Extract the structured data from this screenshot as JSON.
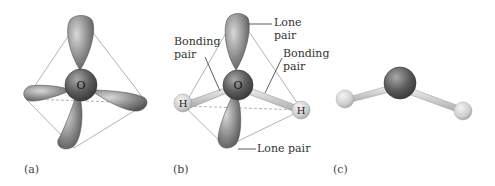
{
  "panels": [
    {
      "id": "a",
      "label": "(a)",
      "center_atom": "O"
    },
    {
      "id": "b",
      "label": "(b)",
      "center_atom": "O",
      "hydrogen_atoms": [
        "H",
        "H"
      ],
      "annotations": {
        "lone_pair_top": {
          "line1": "Lone",
          "line2": "pair"
        },
        "bonding_pair_left": {
          "line1": "Bonding",
          "line2": "pair"
        },
        "bonding_pair_right": {
          "line1": "Bonding",
          "line2": "pair"
        },
        "lone_pair_bottom": "Lone pair"
      }
    },
    {
      "id": "c",
      "label": "(c)"
    }
  ],
  "colors": {
    "lobe": "#8a8a8a",
    "oxygen": "#5e5e5e",
    "hydrogen": "#d0d0d0",
    "edges": "#9a9a9a"
  }
}
